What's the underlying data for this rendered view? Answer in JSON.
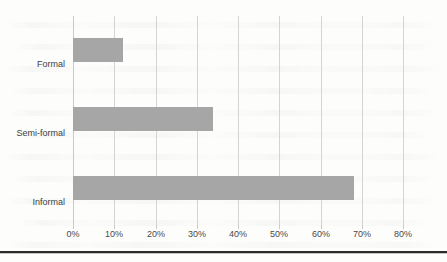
{
  "chart_data": {
    "type": "bar",
    "orientation": "horizontal",
    "title": "",
    "subtitle": "",
    "xlabel": "",
    "ylabel": "",
    "categories": [
      "Formal",
      "Semi-formal",
      "Informal"
    ],
    "values": [
      12,
      34,
      68
    ],
    "series": [
      {
        "name": "",
        "values": [
          12,
          34,
          68
        ]
      }
    ],
    "xlim": [
      0,
      80
    ],
    "xticks": [
      0,
      10,
      20,
      30,
      40,
      50,
      60,
      70,
      80
    ],
    "xtick_labels": [
      "0%",
      "10%",
      "20%",
      "30%",
      "40%",
      "50%",
      "60%",
      "70%",
      "80%"
    ],
    "value_format": "percent",
    "grid": true,
    "grid_axis": "x",
    "legend": false,
    "legend_position": "none",
    "annotations": []
  },
  "colors": {
    "bar": "#a6a6a6",
    "gridline": "#d4d4d4",
    "axis": "#c9c9c9",
    "tick_text": "#4a4a4a",
    "category_text": "#404040",
    "background": "#fdfdfc",
    "bottom_rule": "#2b2b2b"
  }
}
